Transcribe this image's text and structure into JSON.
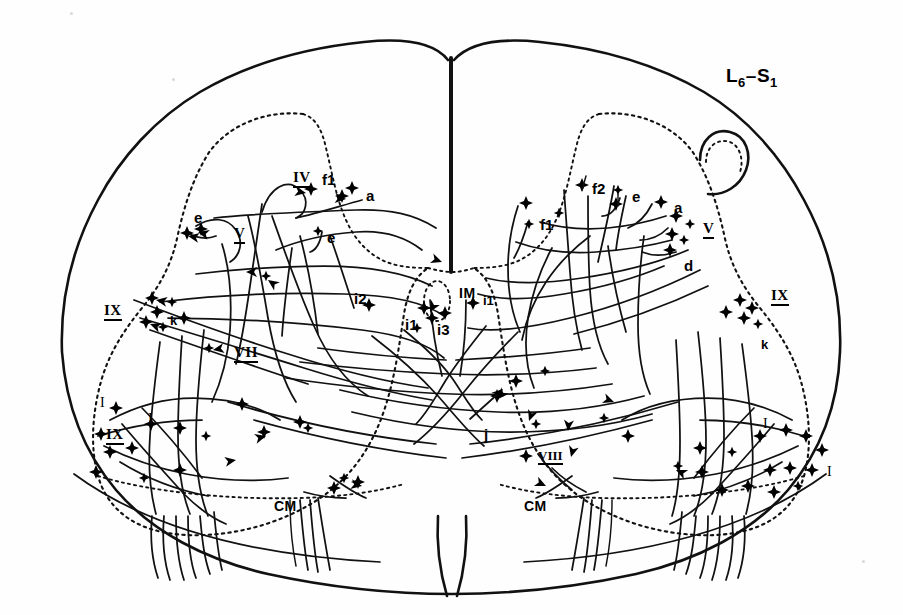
{
  "figure": {
    "kind": "spinal-cord-transverse-section-camera-lucida",
    "segment_label_prefix": "L",
    "segment_label": "L6-S1",
    "segment_parts": {
      "first_letter": "L",
      "first_sub": "6",
      "dash": "–",
      "second_letter": "S",
      "second_sub": "1"
    },
    "ink_color": "#000000",
    "background_color": "#fefefe",
    "outline_style": "solid",
    "gray_matter_style": "dotted"
  },
  "labels": {
    "segment": {
      "text": "L6-S1",
      "x": 726,
      "y": 66
    },
    "laminae": [
      {
        "id": "lamina-IV-left",
        "text": "IV",
        "x": 293,
        "y": 170,
        "class": "lam"
      },
      {
        "id": "lamina-V-left",
        "text": "V",
        "x": 234,
        "y": 226,
        "class": "lam"
      },
      {
        "id": "lamina-IX-left-dorsal",
        "text": "IX",
        "x": 104,
        "y": 303,
        "class": "lam"
      },
      {
        "id": "lamina-VII-left",
        "text": "VII",
        "x": 234,
        "y": 345,
        "class": "lam"
      },
      {
        "id": "lamina-IX-left-ventral",
        "text": "IX",
        "x": 106,
        "y": 427,
        "class": "lam"
      },
      {
        "id": "lamina-V-right",
        "text": "V",
        "x": 703,
        "y": 221,
        "class": "lam"
      },
      {
        "id": "lamina-IX-right-dorsal",
        "text": "IX",
        "x": 771,
        "y": 288,
        "class": "lam"
      },
      {
        "id": "lamina-VIII-right",
        "text": "VIII",
        "x": 538,
        "y": 449,
        "class": "lam-sm"
      }
    ],
    "lamina_I_marks": [
      {
        "id": "lamina-I-left-a",
        "text": "I",
        "x": 100,
        "y": 396
      },
      {
        "id": "lamina-I-left-b",
        "text": "I",
        "x": 148,
        "y": 412
      },
      {
        "id": "lamina-I-right-a",
        "text": "I",
        "x": 763,
        "y": 417
      },
      {
        "id": "lamina-I-right-b",
        "text": "I",
        "x": 827,
        "y": 465
      }
    ],
    "nuclei": [
      {
        "id": "nucleus-IM",
        "text": "IM",
        "x": 459,
        "y": 286
      },
      {
        "id": "nucleus-CM-left",
        "text": "CM",
        "x": 274,
        "y": 499
      },
      {
        "id": "nucleus-CM-right",
        "text": "CM",
        "x": 524,
        "y": 499
      }
    ],
    "axon_classes": [
      {
        "id": "axon-f1-left",
        "text": "f1",
        "x": 322,
        "y": 172,
        "class": "ax"
      },
      {
        "id": "axon-a-left",
        "text": "a",
        "x": 366,
        "y": 188,
        "class": "ax"
      },
      {
        "id": "axon-e-left-1",
        "text": "e",
        "x": 194,
        "y": 210,
        "class": "ax"
      },
      {
        "id": "axon-e-left-2",
        "text": "e",
        "x": 327,
        "y": 230,
        "class": "ax"
      },
      {
        "id": "axon-k-left",
        "text": "k",
        "x": 170,
        "y": 314,
        "class": "ax-sm"
      },
      {
        "id": "axon-i2",
        "text": "i2",
        "x": 354,
        "y": 291,
        "class": "ax"
      },
      {
        "id": "axon-i1-left",
        "text": "i1",
        "x": 408,
        "y": 317,
        "class": "ax"
      },
      {
        "id": "axon-i3",
        "text": "i3",
        "x": 437,
        "y": 322,
        "class": "ax"
      },
      {
        "id": "axon-i1-right",
        "text": "i1",
        "x": 483,
        "y": 294,
        "class": "ax-sm"
      },
      {
        "id": "axon-f2-right",
        "text": "f2",
        "x": 592,
        "y": 181,
        "class": "ax"
      },
      {
        "id": "axon-e-right-1",
        "text": "e",
        "x": 632,
        "y": 189,
        "class": "ax"
      },
      {
        "id": "axon-a-right",
        "text": "a",
        "x": 674,
        "y": 200,
        "class": "ax"
      },
      {
        "id": "axon-f1-right",
        "text": "f1",
        "x": 540,
        "y": 217,
        "class": "ax"
      },
      {
        "id": "axon-d-right",
        "text": "d",
        "x": 684,
        "y": 258,
        "class": "ax"
      },
      {
        "id": "axon-k-right",
        "text": "k",
        "x": 761,
        "y": 338,
        "class": "ax-sm"
      },
      {
        "id": "axon-j",
        "text": "j",
        "x": 484,
        "y": 427,
        "class": "ax"
      }
    ]
  },
  "geometry": {
    "cord_outline": "M 62,350 C 60,300 72,248 98,200 C 120,158 156,118 200,92 C 248,64 306,48 364,42 C 400,38 432,40 448,58 L 452,58 C 470,40 500,38 538,42 C 598,48 656,64 704,92 C 748,118 782,158 804,200 C 830,248 842,300 840,350 C 838,404 820,452 788,490 C 752,532 698,560 636,574 C 572,588 506,594 452,594 C 398,594 332,588 268,574 C 206,560 152,532 116,490 C 84,452 66,404 62,350 Z",
    "median_septum": {
      "x": 451,
      "y1": 56,
      "y2": 272,
      "width": 4
    },
    "ventral_fissure": "M 437,520 C 437,560 441,580 448,596 M 465,520 C 465,560 461,580 454,596",
    "gray_left": "M 310,112 C 268,110 226,126 206,160 C 190,188 182,216 176,242 C 166,282 146,310 120,344 C 100,372 88,406 88,440 C 88,474 100,504 124,520 C 152,538 196,542 240,536 C 286,530 330,514 358,492 C 386,470 402,444 412,414 C 420,390 424,360 428,330 C 432,300 436,280 444,268 L 444,268 L 434,266 C 416,266 400,262 386,252 C 368,240 356,222 348,200 C 340,176 336,150 330,132 C 326,118 320,112 310,112 Z",
    "gray_right": "M 592,112 C 634,110 676,126 696,160 C 712,188 720,216 726,242 C 736,282 756,310 782,344 C 802,372 814,406 814,440 C 814,474 802,504 778,520 C 750,538 706,542 662,536 C 616,530 572,514 544,492 C 516,470 500,444 490,414 C 482,390 478,360 474,330 C 470,300 466,280 458,268 L 468,266 C 486,266 502,262 516,252 C 534,240 546,222 554,200 C 562,176 566,150 572,132 C 576,118 582,112 592,112 Z",
    "gray_commissure": "M 330,366 C 360,372 396,376 432,378 C 450,379 470,379 488,378 C 524,376 560,372 590,366",
    "IM_nucleus_oval": {
      "cx": 437,
      "cy": 301,
      "rx": 13,
      "ry": 20
    },
    "dorsal_funiculus_left": "M 312,118 C 286,114 256,122 238,146",
    "lissauer_right_hook": "M 714,150 C 728,142 742,148 744,162 C 746,178 734,190 718,188"
  },
  "counts": {
    "labeled_laminae": 8,
    "lamina_I_marks": 4,
    "nuclei_labels": 3,
    "axon_class_labels": 16
  }
}
